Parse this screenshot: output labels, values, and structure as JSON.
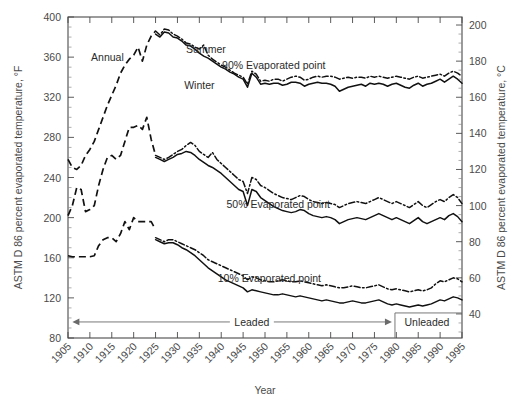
{
  "chart_data": {
    "type": "line",
    "title": "",
    "xlabel": "Year",
    "ylabel": "ASTM D 86 percent evaporated temperature, °F",
    "ylabel_right": "ASTM D 86 percent evaporated temperature, °C",
    "xlim": [
      1905,
      1995
    ],
    "ylim": [
      80,
      400
    ],
    "ylim_right": [
      26.7,
      204.4
    ],
    "yticks": [
      80,
      120,
      160,
      200,
      240,
      280,
      320,
      360,
      400
    ],
    "yticks_right": [
      40,
      60,
      80,
      100,
      120,
      140,
      160,
      180,
      200
    ],
    "xticks": [
      1905,
      1910,
      1915,
      1920,
      1925,
      1930,
      1935,
      1940,
      1945,
      1950,
      1955,
      1960,
      1965,
      1970,
      1975,
      1980,
      1985,
      1990,
      1995
    ],
    "grid": false,
    "legend": "inline-annotations",
    "annotations": [
      {
        "text": "Annual",
        "x": 1914.0,
        "y": 360
      },
      {
        "text": "Summer",
        "x": 1936.5,
        "y": 368
      },
      {
        "text": "Winter",
        "x": 1935.0,
        "y": 332
      },
      {
        "text": "90% Evaporated point",
        "x": 1952.0,
        "y": 352
      },
      {
        "text": "50% Evaporated point",
        "x": 1953.0,
        "y": 214
      },
      {
        "text": "10% Evaporated point",
        "x": 1951.0,
        "y": 140
      },
      {
        "text": "Leaded",
        "x": 1947.0,
        "y": 96
      },
      {
        "text": "Unleaded",
        "x": 1987.0,
        "y": 96
      }
    ],
    "era_markers": {
      "leaded_start": 1906,
      "leaded_end": 1979,
      "unleaded_start": 1979,
      "unleaded_end": 1995
    },
    "series": [
      {
        "name": "Annual 90% evaporated point",
        "style": "dashed",
        "x": [
          1905,
          1906,
          1907,
          1908,
          1909,
          1910,
          1911,
          1912,
          1913,
          1914,
          1915,
          1916,
          1917,
          1918,
          1919,
          1920,
          1921,
          1922,
          1923,
          1924,
          1925
        ],
        "values": [
          258,
          250,
          248,
          252,
          262,
          268,
          276,
          288,
          300,
          312,
          322,
          332,
          344,
          352,
          358,
          362,
          370,
          356,
          372,
          381,
          386
        ]
      },
      {
        "name": "Summer 90% evaporated point",
        "style": "dash-dot",
        "x": [
          1925,
          1926,
          1927,
          1928,
          1929,
          1930,
          1931,
          1932,
          1933,
          1934,
          1935,
          1936,
          1937,
          1938,
          1939,
          1940,
          1941,
          1942,
          1943,
          1944,
          1945,
          1946,
          1947,
          1948,
          1949,
          1950,
          1951,
          1952,
          1953,
          1954,
          1955,
          1956,
          1957,
          1958,
          1959,
          1960,
          1961,
          1962,
          1963,
          1964,
          1965,
          1966,
          1967,
          1968,
          1969,
          1970,
          1971,
          1972,
          1973,
          1974,
          1975,
          1976,
          1977,
          1978,
          1979,
          1980,
          1981,
          1982,
          1983,
          1984,
          1985,
          1986,
          1987,
          1988,
          1989,
          1990,
          1991,
          1992,
          1993,
          1994,
          1995
        ],
        "values": [
          386,
          382,
          388,
          387,
          383,
          381,
          378,
          374,
          373,
          370,
          368,
          372,
          362,
          358,
          355,
          352,
          350,
          347,
          344,
          342,
          340,
          333,
          346,
          343,
          336,
          337,
          336,
          338,
          338,
          336,
          338,
          340,
          341,
          340,
          337,
          338,
          340,
          341,
          340,
          341,
          341,
          340,
          338,
          339,
          340,
          339,
          340,
          340,
          339,
          341,
          340,
          341,
          340,
          339,
          340,
          341,
          340,
          339,
          338,
          340,
          341,
          339,
          340,
          341,
          342,
          343,
          341,
          344,
          346,
          344,
          341
        ]
      },
      {
        "name": "Winter 90% evaporated point",
        "style": "solid",
        "x": [
          1925,
          1926,
          1927,
          1928,
          1929,
          1930,
          1931,
          1932,
          1933,
          1934,
          1935,
          1936,
          1937,
          1938,
          1939,
          1940,
          1941,
          1942,
          1943,
          1944,
          1945,
          1946,
          1947,
          1948,
          1949,
          1950,
          1951,
          1952,
          1953,
          1954,
          1955,
          1956,
          1957,
          1958,
          1959,
          1960,
          1961,
          1962,
          1963,
          1964,
          1965,
          1966,
          1967,
          1968,
          1969,
          1970,
          1971,
          1972,
          1973,
          1974,
          1975,
          1976,
          1977,
          1978,
          1979,
          1980,
          1981,
          1982,
          1983,
          1984,
          1985,
          1986,
          1987,
          1988,
          1989,
          1990,
          1991,
          1992,
          1993,
          1994,
          1995
        ],
        "values": [
          383,
          380,
          385,
          384,
          380,
          379,
          376,
          372,
          371,
          368,
          364,
          361,
          359,
          356,
          353,
          350,
          348,
          345,
          343,
          340,
          338,
          330,
          344,
          340,
          333,
          334,
          333,
          334,
          334,
          332,
          333,
          335,
          335,
          334,
          331,
          333,
          334,
          335,
          334,
          334,
          333,
          331,
          326,
          328,
          330,
          331,
          332,
          333,
          331,
          334,
          333,
          334,
          333,
          331,
          333,
          334,
          332,
          330,
          329,
          332,
          334,
          331,
          333,
          334,
          336,
          338,
          335,
          338,
          341,
          338,
          334
        ]
      },
      {
        "name": "Annual 50% evaporated point",
        "style": "dashed",
        "x": [
          1905,
          1906,
          1907,
          1908,
          1909,
          1910,
          1911,
          1912,
          1913,
          1914,
          1915,
          1916,
          1917,
          1918,
          1919,
          1920,
          1921,
          1922,
          1923,
          1924,
          1925
        ],
        "values": [
          202,
          212,
          230,
          228,
          206,
          208,
          212,
          232,
          248,
          260,
          262,
          258,
          262,
          276,
          290,
          290,
          292,
          288,
          300,
          278,
          262
        ]
      },
      {
        "name": "Summer 50% evaporated point",
        "style": "dash-dot",
        "x": [
          1925,
          1926,
          1927,
          1928,
          1929,
          1930,
          1931,
          1932,
          1933,
          1934,
          1935,
          1936,
          1937,
          1938,
          1939,
          1940,
          1941,
          1942,
          1943,
          1944,
          1945,
          1946,
          1947,
          1948,
          1949,
          1950,
          1951,
          1952,
          1953,
          1954,
          1955,
          1956,
          1957,
          1958,
          1959,
          1960,
          1961,
          1962,
          1963,
          1964,
          1965,
          1966,
          1967,
          1968,
          1969,
          1970,
          1971,
          1972,
          1973,
          1974,
          1975,
          1976,
          1977,
          1978,
          1979,
          1980,
          1981,
          1982,
          1983,
          1984,
          1985,
          1986,
          1987,
          1988,
          1989,
          1990,
          1991,
          1992,
          1993,
          1994,
          1995
        ],
        "values": [
          262,
          260,
          258,
          260,
          263,
          266,
          268,
          272,
          275,
          272,
          266,
          263,
          260,
          265,
          258,
          254,
          250,
          246,
          242,
          238,
          236,
          224,
          240,
          238,
          232,
          230,
          227,
          224,
          222,
          220,
          219,
          218,
          220,
          222,
          221,
          218,
          216,
          215,
          214,
          215,
          214,
          213,
          210,
          212,
          214,
          215,
          216,
          215,
          214,
          216,
          218,
          220,
          218,
          216,
          214,
          216,
          214,
          212,
          210,
          213,
          216,
          212,
          210,
          213,
          216,
          218,
          216,
          220,
          223,
          220,
          214
        ]
      },
      {
        "name": "Winter 50% evaporated point",
        "style": "solid",
        "x": [
          1925,
          1926,
          1927,
          1928,
          1929,
          1930,
          1931,
          1932,
          1933,
          1934,
          1935,
          1936,
          1937,
          1938,
          1939,
          1940,
          1941,
          1942,
          1943,
          1944,
          1945,
          1946,
          1947,
          1948,
          1949,
          1950,
          1951,
          1952,
          1953,
          1954,
          1955,
          1956,
          1957,
          1958,
          1959,
          1960,
          1961,
          1962,
          1963,
          1964,
          1965,
          1966,
          1967,
          1968,
          1969,
          1970,
          1971,
          1972,
          1973,
          1974,
          1975,
          1976,
          1977,
          1978,
          1979,
          1980,
          1981,
          1982,
          1983,
          1984,
          1985,
          1986,
          1987,
          1988,
          1989,
          1990,
          1991,
          1992,
          1993,
          1994,
          1995
        ],
        "values": [
          260,
          258,
          256,
          258,
          260,
          263,
          264,
          266,
          265,
          262,
          258,
          255,
          252,
          250,
          247,
          244,
          240,
          236,
          232,
          228,
          226,
          212,
          228,
          226,
          220,
          217,
          214,
          211,
          209,
          207,
          206,
          205,
          206,
          208,
          207,
          204,
          202,
          201,
          200,
          201,
          200,
          198,
          194,
          196,
          198,
          199,
          200,
          199,
          198,
          200,
          202,
          204,
          202,
          200,
          198,
          200,
          198,
          196,
          194,
          197,
          200,
          196,
          194,
          196,
          198,
          200,
          198,
          202,
          204,
          201,
          196
        ]
      },
      {
        "name": "Annual 10% evaporated point",
        "style": "dashed",
        "x": [
          1905,
          1906,
          1907,
          1908,
          1909,
          1910,
          1911,
          1912,
          1913,
          1914,
          1915,
          1916,
          1917,
          1918,
          1919,
          1920,
          1921,
          1922,
          1923,
          1924,
          1925
        ],
        "values": [
          162,
          161,
          161,
          161,
          161,
          161,
          162,
          172,
          178,
          180,
          180,
          176,
          184,
          196,
          188,
          200,
          196,
          196,
          196,
          196,
          188
        ]
      },
      {
        "name": "Summer 10% evaporated point",
        "style": "dash-dot",
        "x": [
          1925,
          1926,
          1927,
          1928,
          1929,
          1930,
          1931,
          1932,
          1933,
          1934,
          1935,
          1936,
          1937,
          1938,
          1939,
          1940,
          1941,
          1942,
          1943,
          1944,
          1945,
          1946,
          1947,
          1948,
          1949,
          1950,
          1951,
          1952,
          1953,
          1954,
          1955,
          1956,
          1957,
          1958,
          1959,
          1960,
          1961,
          1962,
          1963,
          1964,
          1965,
          1966,
          1967,
          1968,
          1969,
          1970,
          1971,
          1972,
          1973,
          1974,
          1975,
          1976,
          1977,
          1978,
          1979,
          1980,
          1981,
          1982,
          1983,
          1984,
          1985,
          1986,
          1987,
          1988,
          1989,
          1990,
          1991,
          1992,
          1993,
          1994,
          1995
        ],
        "values": [
          180,
          178,
          176,
          178,
          178,
          176,
          174,
          172,
          170,
          168,
          165,
          162,
          158,
          156,
          154,
          152,
          150,
          148,
          146,
          144,
          142,
          138,
          141,
          140,
          138,
          137,
          136,
          136,
          137,
          138,
          137,
          136,
          136,
          137,
          136,
          135,
          134,
          133,
          132,
          133,
          132,
          131,
          130,
          130,
          131,
          132,
          131,
          130,
          130,
          131,
          132,
          133,
          131,
          129,
          128,
          129,
          128,
          127,
          126,
          127,
          128,
          127,
          128,
          130,
          134,
          137,
          136,
          138,
          140,
          139,
          136
        ]
      },
      {
        "name": "Winter 10% evaporated point",
        "style": "solid",
        "x": [
          1925,
          1926,
          1927,
          1928,
          1929,
          1930,
          1931,
          1932,
          1933,
          1934,
          1935,
          1936,
          1937,
          1938,
          1939,
          1940,
          1941,
          1942,
          1943,
          1944,
          1945,
          1946,
          1947,
          1948,
          1949,
          1950,
          1951,
          1952,
          1953,
          1954,
          1955,
          1956,
          1957,
          1958,
          1959,
          1960,
          1961,
          1962,
          1963,
          1964,
          1965,
          1966,
          1967,
          1968,
          1969,
          1970,
          1971,
          1972,
          1973,
          1974,
          1975,
          1976,
          1977,
          1978,
          1979,
          1980,
          1981,
          1982,
          1983,
          1984,
          1985,
          1986,
          1987,
          1988,
          1989,
          1990,
          1991,
          1992,
          1993,
          1994,
          1995
        ],
        "values": [
          178,
          176,
          174,
          175,
          175,
          173,
          170,
          168,
          165,
          162,
          158,
          154,
          150,
          147,
          144,
          141,
          138,
          136,
          134,
          132,
          130,
          126,
          128,
          127,
          126,
          125,
          124,
          123,
          123,
          124,
          123,
          122,
          121,
          122,
          121,
          120,
          119,
          118,
          117,
          118,
          117,
          116,
          115,
          115,
          116,
          117,
          116,
          115,
          115,
          116,
          117,
          118,
          116,
          114,
          113,
          114,
          113,
          112,
          111,
          112,
          113,
          112,
          113,
          114,
          116,
          118,
          117,
          119,
          121,
          120,
          118
        ]
      }
    ]
  }
}
